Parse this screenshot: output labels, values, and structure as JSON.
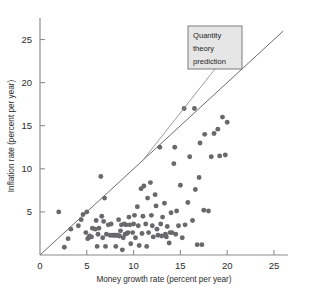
{
  "chart_data": {
    "type": "scatter",
    "title": "",
    "xlabel": "Money growth rate (percent per year)",
    "ylabel": "Inflation rate (percent per year)",
    "xlim": [
      0,
      26.5
    ],
    "ylim": [
      0,
      27.5
    ],
    "xticks": [
      0,
      5,
      10,
      15,
      20,
      25
    ],
    "yticks": [
      5,
      10,
      15,
      20,
      25
    ],
    "xtick_labels": [
      "0",
      "5",
      "10",
      "15",
      "20",
      "25"
    ],
    "ytick_labels": [
      "5",
      "10",
      "15",
      "20",
      "25"
    ],
    "grid": false,
    "legend": null,
    "annotations": [
      {
        "name": "quantity-theory-prediction",
        "lines": [
          "Quantity",
          "theory",
          "prediction"
        ],
        "points_to_x": 11.0,
        "points_to_y": 11.0
      }
    ],
    "reference_line": {
      "name": "45-degree-quantity-theory-line",
      "x_start": 0.0,
      "y_start": 0.0,
      "x_end": 26.0,
      "y_end": 26.0,
      "slope": 1,
      "intercept": 0
    },
    "series": [
      {
        "name": "Countries",
        "marker": "circle",
        "color": "#69696b",
        "points": [
          [
            2.0,
            5.0
          ],
          [
            2.6,
            0.9
          ],
          [
            3.0,
            1.9
          ],
          [
            3.3,
            3.0
          ],
          [
            4.1,
            3.4
          ],
          [
            4.4,
            4.1
          ],
          [
            4.6,
            4.7
          ],
          [
            4.9,
            2.6
          ],
          [
            5.0,
            5.0
          ],
          [
            5.1,
            1.9
          ],
          [
            5.2,
            2.0
          ],
          [
            5.3,
            2.2
          ],
          [
            5.5,
            2.1
          ],
          [
            5.6,
            3.1
          ],
          [
            5.9,
            3.0
          ],
          [
            6.0,
            4.0
          ],
          [
            6.1,
            1.0
          ],
          [
            6.2,
            2.4
          ],
          [
            6.3,
            3.1
          ],
          [
            6.5,
            9.1
          ],
          [
            6.6,
            4.5
          ],
          [
            6.7,
            2.0
          ],
          [
            6.8,
            3.9
          ],
          [
            6.9,
            6.6
          ],
          [
            7.0,
            1.0
          ],
          [
            7.1,
            2.4
          ],
          [
            7.3,
            3.5
          ],
          [
            7.5,
            2.3
          ],
          [
            7.6,
            3.6
          ],
          [
            7.7,
            2.3
          ],
          [
            7.9,
            2.3
          ],
          [
            8.0,
            2.3
          ],
          [
            8.1,
            1.0
          ],
          [
            8.2,
            2.3
          ],
          [
            8.3,
            2.3
          ],
          [
            8.4,
            4.1
          ],
          [
            8.5,
            2.2
          ],
          [
            8.6,
            2.8
          ],
          [
            8.7,
            3.5
          ],
          [
            8.8,
            0.6
          ],
          [
            8.9,
            2.0
          ],
          [
            9.0,
            3.6
          ],
          [
            9.1,
            2.4
          ],
          [
            9.2,
            3.5
          ],
          [
            9.3,
            2.5
          ],
          [
            9.4,
            2.6
          ],
          [
            9.5,
            4.4
          ],
          [
            9.6,
            3.5
          ],
          [
            9.7,
            1.3
          ],
          [
            9.9,
            2.6
          ],
          [
            10.0,
            3.6
          ],
          [
            10.1,
            4.6
          ],
          [
            10.2,
            2.0
          ],
          [
            10.4,
            5.6
          ],
          [
            10.5,
            3.4
          ],
          [
            10.6,
            1.1
          ],
          [
            10.8,
            7.7
          ],
          [
            10.9,
            2.5
          ],
          [
            11.0,
            4.5
          ],
          [
            11.1,
            8.0
          ],
          [
            11.3,
            3.6
          ],
          [
            11.4,
            1.0
          ],
          [
            11.5,
            6.6
          ],
          [
            11.6,
            2.6
          ],
          [
            11.8,
            8.4
          ],
          [
            11.9,
            4.6
          ],
          [
            12.0,
            3.4
          ],
          [
            12.1,
            2.1
          ],
          [
            12.3,
            7.0
          ],
          [
            12.4,
            5.7
          ],
          [
            12.5,
            3.0
          ],
          [
            12.6,
            2.3
          ],
          [
            12.8,
            12.5
          ],
          [
            12.9,
            3.6
          ],
          [
            13.0,
            2.2
          ],
          [
            13.1,
            4.4
          ],
          [
            13.3,
            6.0
          ],
          [
            13.4,
            2.4
          ],
          [
            13.5,
            2.1
          ],
          [
            13.6,
            3.3
          ],
          [
            13.8,
            1.4
          ],
          [
            13.9,
            2.6
          ],
          [
            14.0,
            4.9
          ],
          [
            14.1,
            2.6
          ],
          [
            14.3,
            10.6
          ],
          [
            14.4,
            12.5
          ],
          [
            14.5,
            2.4
          ],
          [
            14.6,
            5.1
          ],
          [
            14.8,
            3.4
          ],
          [
            15.0,
            8.1
          ],
          [
            15.2,
            2.0
          ],
          [
            15.4,
            17.0
          ],
          [
            15.5,
            3.5
          ],
          [
            15.8,
            6.1
          ],
          [
            16.0,
            11.4
          ],
          [
            16.3,
            4.0
          ],
          [
            16.5,
            17.0
          ],
          [
            16.6,
            7.6
          ],
          [
            16.8,
            1.2
          ],
          [
            17.0,
            9.0
          ],
          [
            17.1,
            13.0
          ],
          [
            17.3,
            1.2
          ],
          [
            17.5,
            5.2
          ],
          [
            17.6,
            14.0
          ],
          [
            18.0,
            5.1
          ],
          [
            18.3,
            11.4
          ],
          [
            18.6,
            14.1
          ],
          [
            19.0,
            14.6
          ],
          [
            19.2,
            11.5
          ],
          [
            19.5,
            16.0
          ],
          [
            19.8,
            11.6
          ],
          [
            20.0,
            15.4
          ]
        ]
      }
    ]
  }
}
